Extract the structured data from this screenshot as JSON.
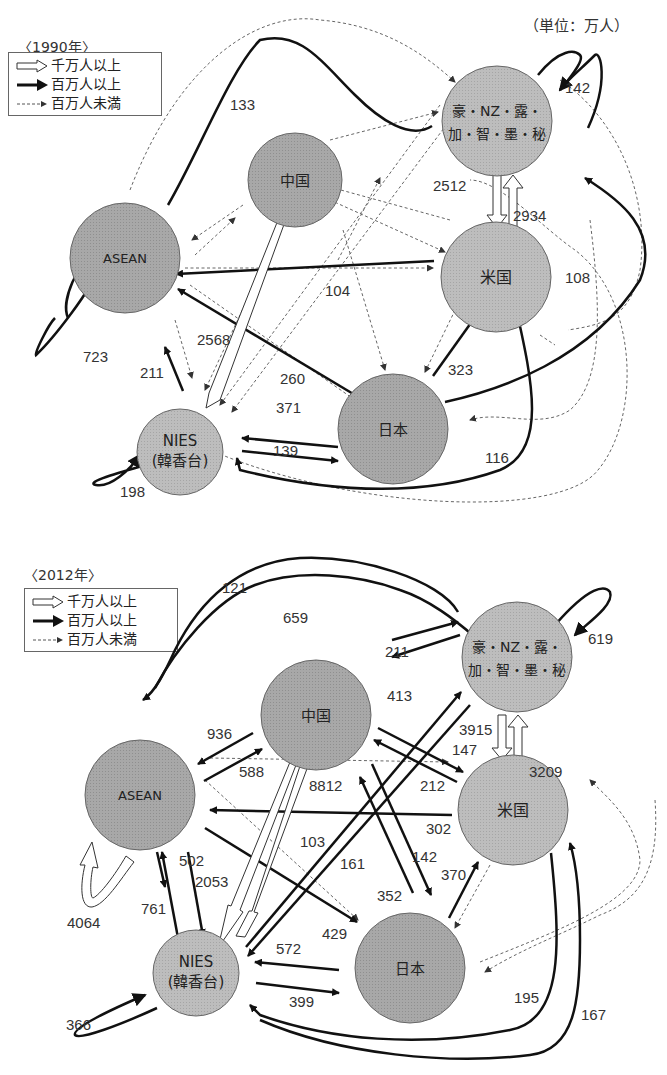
{
  "header": {
    "unit_label": "（単位：万人）"
  },
  "legend": {
    "items": [
      {
        "type": "hollow",
        "label": "千万人以上"
      },
      {
        "type": "solid",
        "label": "百万人以上"
      },
      {
        "type": "dashed",
        "label": "百万人未満"
      }
    ]
  },
  "diagrams": [
    {
      "year_label": "〈1990年〉",
      "nodes": {
        "oceania_americas": {
          "label_line1": "豪・NZ・露・",
          "label_line2": "加・智・墨・秘"
        },
        "china": {
          "label": "中国"
        },
        "asean": {
          "label": "ASEAN"
        },
        "usa": {
          "label": "米国"
        },
        "nies": {
          "label_line1": "NIES",
          "label_line2": "(韓香台)"
        },
        "japan": {
          "label": "日本"
        }
      },
      "values": {
        "asean_to_oceania": "133",
        "oceania_self": "142",
        "oceania_to_usa": "2512",
        "usa_to_oceania": "2934",
        "usa_to_asean": "104",
        "japan_to_oceania": "108",
        "asean_self": "723",
        "china_to_nies": "2568",
        "nies_to_asean": "211",
        "japan_to_asean": "260",
        "japan_to_usa": "323",
        "japan_to_nies": "371",
        "nies_to_japan": "139",
        "usa_to_nies": "116",
        "nies_self": "198"
      }
    },
    {
      "year_label": "〈2012年〉",
      "nodes": {
        "oceania_americas": {
          "label_line1": "豪・NZ・露・",
          "label_line2": "加・智・墨・秘"
        },
        "china": {
          "label": "中国"
        },
        "asean": {
          "label": "ASEAN"
        },
        "usa": {
          "label": "米国"
        },
        "nies": {
          "label_line1": "NIES",
          "label_line2": "(韓香台)"
        },
        "japan": {
          "label": "日本"
        }
      },
      "values": {
        "oceania_to_asean": "121",
        "asean_to_oceania": "659",
        "oceania_self": "619",
        "china_to_oceania": "211",
        "oceania_to_china": "413",
        "china_to_asean": "936",
        "asean_to_china": "588",
        "oceania_to_usa": "3915",
        "usa_to_oceania": "3209",
        "china_to_usa": "147",
        "usa_to_china": "212",
        "china_to_nies": "8812",
        "usa_to_asean": "302",
        "nies_to_oceania": "103",
        "oceania_to_nies": "161",
        "china_to_japan": "142",
        "japan_to_china": "352",
        "japan_to_usa": "370",
        "asean_self": "4064",
        "asean_to_nies": "502",
        "nies_to_asean": "761",
        "nies_to_china": "2053",
        "japan_to_asean": "429",
        "japan_to_nies": "572",
        "nies_to_japan": "399",
        "nies_self": "366",
        "usa_to_nies": "195",
        "nies_to_usa": "167"
      }
    }
  ]
}
